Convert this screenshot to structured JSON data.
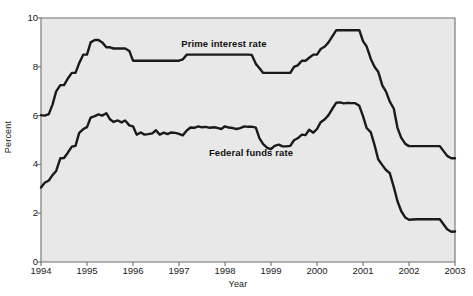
{
  "chart_data": {
    "type": "line",
    "title": "",
    "xlabel": "Year",
    "ylabel": "Percent",
    "ylim": [
      0,
      10
    ],
    "xlim": [
      1994,
      2003
    ],
    "yticks": [
      0,
      2,
      4,
      6,
      8,
      10
    ],
    "xticks": [
      1994,
      1995,
      1996,
      1997,
      1998,
      1999,
      2000,
      2001,
      2002,
      2003
    ],
    "grid": false,
    "legend_position": "inline-annotations",
    "plot_background": "#e8e8e8",
    "line_color": "#1a1a1a",
    "series": [
      {
        "name": "Prime interest rate",
        "label_x": 1997.05,
        "label_y": 8.95,
        "x": [
          1994.0,
          1994.08,
          1994.17,
          1994.25,
          1994.33,
          1994.42,
          1994.5,
          1994.58,
          1994.67,
          1994.75,
          1994.83,
          1994.92,
          1995.0,
          1995.08,
          1995.17,
          1995.25,
          1995.33,
          1995.42,
          1995.5,
          1995.58,
          1995.67,
          1995.75,
          1995.83,
          1995.92,
          1996.0,
          1996.08,
          1996.17,
          1996.25,
          1996.33,
          1996.42,
          1996.5,
          1996.58,
          1996.67,
          1996.75,
          1996.83,
          1996.92,
          1997.0,
          1997.08,
          1997.17,
          1997.25,
          1997.33,
          1997.42,
          1997.5,
          1997.58,
          1997.67,
          1997.75,
          1997.83,
          1997.92,
          1998.0,
          1998.08,
          1998.17,
          1998.25,
          1998.33,
          1998.42,
          1998.5,
          1998.58,
          1998.67,
          1998.75,
          1998.83,
          1998.92,
          1999.0,
          1999.08,
          1999.17,
          1999.25,
          1999.33,
          1999.42,
          1999.5,
          1999.58,
          1999.67,
          1999.75,
          1999.83,
          1999.92,
          2000.0,
          2000.08,
          2000.17,
          2000.25,
          2000.33,
          2000.42,
          2000.5,
          2000.58,
          2000.67,
          2000.75,
          2000.83,
          2000.92,
          2001.0,
          2001.08,
          2001.17,
          2001.25,
          2001.33,
          2001.42,
          2001.5,
          2001.58,
          2001.67,
          2001.75,
          2001.83,
          2001.92,
          2002.0,
          2002.17,
          2002.33,
          2002.5,
          2002.67,
          2002.83,
          2002.92,
          2003.0
        ],
        "y": [
          6.02,
          6.0,
          6.06,
          6.45,
          6.99,
          7.25,
          7.25,
          7.51,
          7.75,
          7.75,
          8.15,
          8.5,
          8.5,
          9.0,
          9.1,
          9.1,
          9.0,
          8.8,
          8.8,
          8.75,
          8.75,
          8.75,
          8.75,
          8.65,
          8.25,
          8.25,
          8.25,
          8.25,
          8.25,
          8.25,
          8.25,
          8.25,
          8.25,
          8.25,
          8.25,
          8.25,
          8.25,
          8.3,
          8.5,
          8.5,
          8.5,
          8.5,
          8.5,
          8.5,
          8.5,
          8.5,
          8.5,
          8.5,
          8.5,
          8.5,
          8.5,
          8.5,
          8.5,
          8.5,
          8.5,
          8.49,
          8.12,
          7.94,
          7.75,
          7.75,
          7.75,
          7.75,
          7.75,
          7.75,
          7.75,
          7.75,
          8.0,
          8.06,
          8.25,
          8.25,
          8.37,
          8.5,
          8.5,
          8.73,
          8.83,
          9.0,
          9.24,
          9.5,
          9.5,
          9.5,
          9.5,
          9.5,
          9.5,
          9.5,
          9.05,
          8.83,
          8.32,
          8.0,
          7.8,
          7.24,
          6.98,
          6.58,
          6.28,
          5.5,
          5.1,
          4.84,
          4.75,
          4.75,
          4.75,
          4.75,
          4.75,
          4.35,
          4.25,
          4.25
        ]
      },
      {
        "name": "Federal funds rate",
        "label_x": 1997.65,
        "label_y": 4.45,
        "x": [
          1994.0,
          1994.08,
          1994.17,
          1994.25,
          1994.33,
          1994.42,
          1994.5,
          1994.58,
          1994.67,
          1994.75,
          1994.83,
          1994.92,
          1995.0,
          1995.08,
          1995.17,
          1995.25,
          1995.33,
          1995.42,
          1995.5,
          1995.58,
          1995.67,
          1995.75,
          1995.83,
          1995.92,
          1996.0,
          1996.08,
          1996.17,
          1996.25,
          1996.33,
          1996.42,
          1996.5,
          1996.58,
          1996.67,
          1996.75,
          1996.83,
          1996.92,
          1997.0,
          1997.08,
          1997.17,
          1997.25,
          1997.33,
          1997.42,
          1997.5,
          1997.58,
          1997.67,
          1997.75,
          1997.83,
          1997.92,
          1998.0,
          1998.08,
          1998.17,
          1998.25,
          1998.33,
          1998.42,
          1998.5,
          1998.58,
          1998.67,
          1998.75,
          1998.83,
          1998.92,
          1999.0,
          1999.08,
          1999.17,
          1999.25,
          1999.33,
          1999.42,
          1999.5,
          1999.58,
          1999.67,
          1999.75,
          1999.83,
          1999.92,
          2000.0,
          2000.08,
          2000.17,
          2000.25,
          2000.33,
          2000.42,
          2000.5,
          2000.58,
          2000.67,
          2000.75,
          2000.83,
          2000.92,
          2001.0,
          2001.08,
          2001.17,
          2001.25,
          2001.33,
          2001.42,
          2001.5,
          2001.58,
          2001.67,
          2001.75,
          2001.83,
          2001.92,
          2002.0,
          2002.17,
          2002.33,
          2002.5,
          2002.67,
          2002.83,
          2002.92,
          2003.0
        ],
        "y": [
          3.05,
          3.25,
          3.34,
          3.56,
          3.73,
          4.25,
          4.26,
          4.47,
          4.73,
          4.76,
          5.29,
          5.45,
          5.53,
          5.92,
          5.98,
          6.05,
          6.0,
          6.1,
          5.85,
          5.74,
          5.8,
          5.72,
          5.8,
          5.6,
          5.56,
          5.22,
          5.31,
          5.22,
          5.24,
          5.27,
          5.4,
          5.22,
          5.3,
          5.24,
          5.31,
          5.29,
          5.25,
          5.19,
          5.39,
          5.51,
          5.5,
          5.56,
          5.52,
          5.54,
          5.5,
          5.52,
          5.5,
          5.45,
          5.56,
          5.51,
          5.49,
          5.45,
          5.49,
          5.56,
          5.54,
          5.55,
          5.51,
          5.07,
          4.83,
          4.68,
          4.63,
          4.76,
          4.81,
          4.74,
          4.74,
          4.76,
          4.99,
          5.07,
          5.22,
          5.2,
          5.42,
          5.3,
          5.45,
          5.73,
          5.85,
          6.02,
          6.27,
          6.53,
          6.54,
          6.5,
          6.52,
          6.51,
          6.51,
          6.4,
          5.98,
          5.49,
          5.31,
          4.8,
          4.21,
          3.97,
          3.77,
          3.65,
          3.07,
          2.49,
          2.09,
          1.82,
          1.73,
          1.75,
          1.75,
          1.75,
          1.75,
          1.34,
          1.24,
          1.25
        ]
      }
    ]
  },
  "axis": {
    "ylabel": "Percent",
    "xlabel": "Year",
    "yticks": [
      "10",
      "8",
      "6",
      "4",
      "2",
      "0"
    ],
    "xticks": [
      "1994",
      "1995",
      "1996",
      "1997",
      "1998",
      "1999",
      "2000",
      "2001",
      "2002",
      "2003"
    ]
  },
  "annotations": {
    "prime": "Prime interest rate",
    "federal": "Federal funds rate"
  }
}
